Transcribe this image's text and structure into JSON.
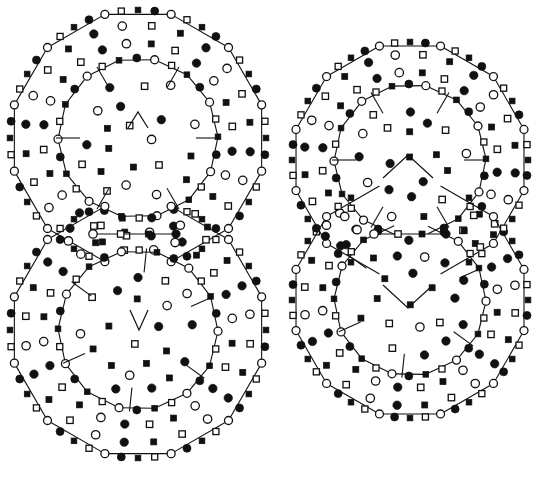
{
  "figure": {
    "background_color": "#ffffff",
    "stroke_color": "#111111",
    "width": 548,
    "height": 486
  },
  "legend_symbols": [
    {
      "key": "filled-circle",
      "name": "filled-circle-marker",
      "fill": "#111111",
      "shape": "circle",
      "radius": 4.2
    },
    {
      "key": "open-circle",
      "name": "open-circle-marker",
      "fill": "#ffffff",
      "shape": "circle",
      "radius": 4.2
    },
    {
      "key": "filled-square",
      "name": "filled-square-marker",
      "fill": "#111111",
      "shape": "square",
      "size": 6.0
    },
    {
      "key": "open-square",
      "name": "open-square-marker",
      "fill": "#ffffff",
      "shape": "square",
      "size": 6.4
    }
  ],
  "chart_data": {
    "type": "scatter",
    "xlabel": "",
    "ylabel": "",
    "grid": false,
    "legend_position": "none",
    "clusters": [
      {
        "id": "left-cluster",
        "name": "left-cluster",
        "label": "Left double-ring cluster",
        "units": [
          {
            "id": "left-top-unit",
            "center": [
              138,
              138
            ],
            "outer_polygon": {
              "sides": 12,
              "radius": 128,
              "rotation": -15
            },
            "inner_polygon": {
              "sides": 14,
              "radius": 80,
              "rotation": 12
            },
            "center_motif": "chevron-up",
            "center_motif_points": "128,128 138,112 148,128",
            "ring_marker_sequence": [
              "open-circle",
              "open-square",
              "filled-square",
              "filled-circle"
            ],
            "mid_ring_count": 24,
            "core_marker_count": 21
          },
          {
            "id": "left-bottom-unit",
            "center": [
              138,
              330
            ],
            "outer_polygon": {
              "sides": 12,
              "radius": 128,
              "rotation": 15
            },
            "inner_polygon": {
              "sides": 14,
              "radius": 80,
              "rotation": -12
            },
            "center_motif": "chevron-down",
            "center_motif_points": "130,310 139,330 148,310",
            "ring_marker_sequence": [
              "open-circle",
              "open-square",
              "filled-square",
              "filled-circle"
            ],
            "mid_ring_count": 24,
            "core_marker_count": 21
          }
        ],
        "junction": {
          "y": 234,
          "x_left": 93,
          "x_right": 176,
          "markers": [
            "open-circle",
            "open-square",
            "filled-square",
            "filled-circle"
          ]
        }
      },
      {
        "id": "right-cluster",
        "name": "right-cluster",
        "label": "Right double-ring cluster",
        "units": [
          {
            "id": "right-top-unit",
            "center": [
              410,
              160
            ],
            "outer_polygon": {
              "sides": 12,
              "radius": 118,
              "rotation": -15
            },
            "inner_polygon": {
              "sides": 14,
              "radius": 76,
              "rotation": 12
            },
            "center_motif": "tent-up",
            "center_motif_points": "383,178 408,155 433,178",
            "ring_marker_sequence": [
              "open-circle",
              "open-square",
              "filled-square",
              "filled-circle"
            ],
            "mid_ring_count": 24,
            "core_marker_count": 20
          },
          {
            "id": "right-bottom-unit",
            "center": [
              410,
              300
            ],
            "outer_polygon": {
              "sides": 12,
              "radius": 118,
              "rotation": 15
            },
            "inner_polygon": {
              "sides": 14,
              "radius": 76,
              "rotation": -12
            },
            "center_motif": "tent-down",
            "center_motif_points": "383,285 408,308 433,285",
            "ring_marker_sequence": [
              "open-circle",
              "open-square",
              "filled-square",
              "filled-circle"
            ],
            "mid_ring_count": 24,
            "core_marker_count": 20
          }
        ],
        "junction": {
          "y": 234,
          "x_left": 374,
          "x_right": 446,
          "markers": [
            "open-circle",
            "open-square",
            "filled-square",
            "filled-circle"
          ]
        }
      }
    ]
  }
}
